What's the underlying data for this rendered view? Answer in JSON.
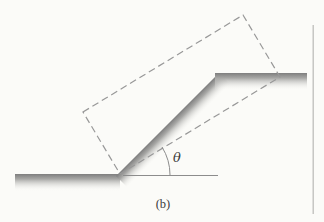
{
  "figure": {
    "caption": "(b)",
    "angle_label": "θ"
  },
  "colors": {
    "background": "#fbfbf8",
    "surface_edge": "#7e7e7e",
    "surface_mid": "#a8a8a6",
    "surface_fade": "#fafaf7",
    "dashed_outline": "#989898",
    "thin_line": "#8c8c8c",
    "label_text": "#3c3c3c",
    "page_border": "#bdbdbb"
  }
}
